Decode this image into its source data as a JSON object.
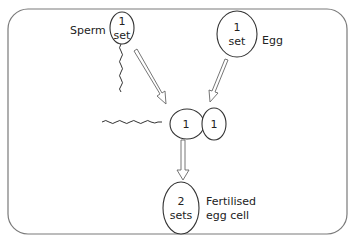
{
  "diagram": {
    "border_color": "#7a7a7a",
    "sperm": {
      "label": "Sperm",
      "line1": "1",
      "line2": "set"
    },
    "egg": {
      "label": "Egg",
      "line1": "1",
      "line2": "set"
    },
    "fusion": {
      "sperm_value": "1",
      "egg_value": "1"
    },
    "zygote": {
      "line1": "2",
      "line2": "sets",
      "label_line1": "Fertilised",
      "label_line2": "egg cell"
    },
    "arrows": [
      {
        "from": "sperm",
        "to": "fusion"
      },
      {
        "from": "egg",
        "to": "fusion"
      },
      {
        "from": "fusion",
        "to": "zygote"
      }
    ]
  }
}
